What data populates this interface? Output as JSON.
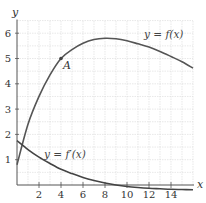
{
  "chart_data": {
    "type": "line",
    "title": "",
    "xlabel": "x",
    "ylabel": "y",
    "xlim": [
      0,
      16
    ],
    "ylim": [
      0,
      6.5
    ],
    "grid": true,
    "x_ticks": [
      "2",
      "4",
      "6",
      "8",
      "10",
      "12",
      "14"
    ],
    "y_ticks": [
      "1",
      "2",
      "3",
      "4",
      "5",
      "6"
    ],
    "series": [
      {
        "name": "y = f(x)",
        "x": [
          0,
          1,
          2,
          3,
          4,
          5,
          6,
          7,
          8,
          9,
          10,
          11,
          12,
          13,
          14,
          15,
          16
        ],
        "values": [
          0.8,
          2.4,
          3.5,
          4.35,
          5.0,
          5.35,
          5.6,
          5.75,
          5.8,
          5.78,
          5.7,
          5.58,
          5.45,
          5.28,
          5.08,
          4.87,
          4.62
        ]
      },
      {
        "name": "y = f'(x)",
        "x": [
          0,
          1,
          2,
          3,
          4,
          5,
          6,
          7,
          8,
          9,
          10,
          11,
          12,
          13,
          14,
          15,
          16
        ],
        "values": [
          1.75,
          1.4,
          1.1,
          0.85,
          0.62,
          0.45,
          0.3,
          0.18,
          0.08,
          0.0,
          -0.06,
          -0.1,
          -0.13,
          -0.15,
          -0.17,
          -0.18,
          -0.19
        ]
      }
    ],
    "annotations": [
      {
        "text": "A",
        "x": 4,
        "y": 5,
        "marker": "point"
      },
      {
        "text": "y = f(x)",
        "x": 12.5,
        "y": 6.0
      },
      {
        "text": "y = f'(x)",
        "x": 5.5,
        "y": 1.2
      }
    ]
  },
  "labels": {
    "x_axis": "x",
    "y_axis": "y",
    "point_a": "A",
    "f_label": "y = f(x)",
    "fprime_label": "y = f′(x)"
  }
}
